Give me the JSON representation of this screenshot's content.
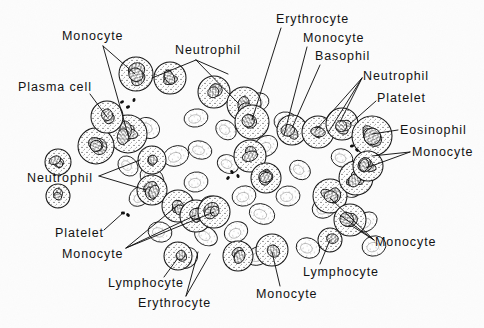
{
  "figure": {
    "background_color": "#fcfcfc",
    "ink_color": "#111111",
    "labels": [
      {
        "id": "monocyte-top-left",
        "text": "Monocyte",
        "x": 62,
        "y": 30
      },
      {
        "id": "neutrophil-top",
        "text": "Neutrophil",
        "x": 175,
        "y": 44
      },
      {
        "id": "erythrocyte-top-right",
        "text": "Erythrocyte",
        "x": 276,
        "y": 13
      },
      {
        "id": "monocyte-top-right",
        "text": "Monocyte",
        "x": 303,
        "y": 32
      },
      {
        "id": "basophil",
        "text": "Basophil",
        "x": 315,
        "y": 50
      },
      {
        "id": "plasma-cell",
        "text": "Plasma cell",
        "x": 18,
        "y": 81
      },
      {
        "id": "neutrophil-right",
        "text": "Neutrophil",
        "x": 363,
        "y": 70
      },
      {
        "id": "platelet-right",
        "text": "Platelet",
        "x": 377,
        "y": 92
      },
      {
        "id": "eosinophil",
        "text": "Eosinophil",
        "x": 400,
        "y": 124
      },
      {
        "id": "monocyte-right-upper",
        "text": "Monocyte",
        "x": 412,
        "y": 146
      },
      {
        "id": "neutrophil-left",
        "text": "Neutrophil",
        "x": 27,
        "y": 172
      },
      {
        "id": "platelet-left",
        "text": "Platelet",
        "x": 55,
        "y": 227
      },
      {
        "id": "monocyte-left-lower",
        "text": "Monocyte",
        "x": 62,
        "y": 248
      },
      {
        "id": "monocyte-right-lower",
        "text": "Monocyte",
        "x": 375,
        "y": 236
      },
      {
        "id": "lymphocyte-right",
        "text": "Lymphocyte",
        "x": 303,
        "y": 266
      },
      {
        "id": "lymphocyte-bottom-left",
        "text": "Lymphocyte",
        "x": 108,
        "y": 277
      },
      {
        "id": "monocyte-bottom",
        "text": "Monocyte",
        "x": 256,
        "y": 288
      },
      {
        "id": "erythrocyte-bottom",
        "text": "Erythrocyte",
        "x": 138,
        "y": 297
      }
    ],
    "leader_lines": [
      {
        "id": "lead-monocyte-top-left-a",
        "x1": 103,
        "y1": 46,
        "x2": 135,
        "y2": 74
      },
      {
        "id": "lead-monocyte-top-left-b",
        "x1": 103,
        "y1": 46,
        "x2": 128,
        "y2": 135
      },
      {
        "id": "lead-neutrophil-top-a",
        "x1": 196,
        "y1": 60,
        "x2": 152,
        "y2": 78
      },
      {
        "id": "lead-neutrophil-top-b",
        "x1": 196,
        "y1": 60,
        "x2": 228,
        "y2": 74
      },
      {
        "id": "lead-neutrophil-top-c",
        "x1": 196,
        "y1": 60,
        "x2": 238,
        "y2": 103
      },
      {
        "id": "lead-plasma-cell",
        "x1": 90,
        "y1": 94,
        "x2": 107,
        "y2": 117
      },
      {
        "id": "lead-erythrocyte-top-right",
        "x1": 281,
        "y1": 28,
        "x2": 252,
        "y2": 120
      },
      {
        "id": "lead-monocyte-top-right",
        "x1": 307,
        "y1": 47,
        "x2": 284,
        "y2": 135
      },
      {
        "id": "lead-basophil",
        "x1": 320,
        "y1": 65,
        "x2": 292,
        "y2": 128
      },
      {
        "id": "lead-neutrophil-right-a",
        "x1": 362,
        "y1": 78,
        "x2": 316,
        "y2": 130
      },
      {
        "id": "lead-neutrophil-right-b",
        "x1": 362,
        "y1": 78,
        "x2": 328,
        "y2": 133
      },
      {
        "id": "lead-neutrophil-right-c",
        "x1": 362,
        "y1": 78,
        "x2": 340,
        "y2": 122
      },
      {
        "id": "lead-platelet-right",
        "x1": 376,
        "y1": 101,
        "x2": 350,
        "y2": 124
      },
      {
        "id": "lead-eosinophil",
        "x1": 398,
        "y1": 130,
        "x2": 372,
        "y2": 134
      },
      {
        "id": "lead-monocyte-right-upper-a",
        "x1": 410,
        "y1": 152,
        "x2": 372,
        "y2": 156
      },
      {
        "id": "lead-monocyte-right-upper-b",
        "x1": 410,
        "y1": 152,
        "x2": 366,
        "y2": 168
      },
      {
        "id": "lead-neutrophil-left-a",
        "x1": 99,
        "y1": 176,
        "x2": 140,
        "y2": 160
      },
      {
        "id": "lead-neutrophil-left-b",
        "x1": 99,
        "y1": 176,
        "x2": 146,
        "y2": 190
      },
      {
        "id": "lead-platelet-left",
        "x1": 104,
        "y1": 230,
        "x2": 124,
        "y2": 212
      },
      {
        "id": "lead-monocyte-left-lower-a",
        "x1": 126,
        "y1": 248,
        "x2": 178,
        "y2": 205
      },
      {
        "id": "lead-monocyte-left-lower-b",
        "x1": 126,
        "y1": 248,
        "x2": 196,
        "y2": 215
      },
      {
        "id": "lead-monocyte-left-lower-c",
        "x1": 126,
        "y1": 248,
        "x2": 214,
        "y2": 212
      },
      {
        "id": "lead-lymphocyte-bottom-left",
        "x1": 164,
        "y1": 277,
        "x2": 178,
        "y2": 258
      },
      {
        "id": "lead-erythrocyte-bottom-a",
        "x1": 186,
        "y1": 296,
        "x2": 198,
        "y2": 252
      },
      {
        "id": "lead-erythrocyte-bottom-b",
        "x1": 186,
        "y1": 296,
        "x2": 210,
        "y2": 254
      },
      {
        "id": "lead-monocyte-bottom",
        "x1": 280,
        "y1": 286,
        "x2": 272,
        "y2": 252
      },
      {
        "id": "lead-lymphocyte-right",
        "x1": 320,
        "y1": 264,
        "x2": 330,
        "y2": 240
      },
      {
        "id": "lead-monocyte-right-lower-a",
        "x1": 374,
        "y1": 240,
        "x2": 330,
        "y2": 198
      },
      {
        "id": "lead-monocyte-right-lower-b",
        "x1": 374,
        "y1": 240,
        "x2": 340,
        "y2": 215
      },
      {
        "id": "lead-monocyte-right-lower-c",
        "x1": 374,
        "y1": 240,
        "x2": 352,
        "y2": 226
      }
    ],
    "cells": {
      "erythrocytes": [
        {
          "cx": 176,
          "cy": 156,
          "rx": 13,
          "ry": 10,
          "rot": -20
        },
        {
          "cx": 200,
          "cy": 150,
          "rx": 12,
          "ry": 9,
          "rot": 15
        },
        {
          "cx": 152,
          "cy": 178,
          "rx": 13,
          "ry": 10,
          "rot": 40
        },
        {
          "cx": 196,
          "cy": 182,
          "rx": 12,
          "ry": 10,
          "rot": -10
        },
        {
          "cx": 228,
          "cy": 164,
          "rx": 11,
          "ry": 9,
          "rot": 25
        },
        {
          "cx": 178,
          "cy": 204,
          "rx": 13,
          "ry": 9,
          "rot": -35
        },
        {
          "cx": 212,
          "cy": 206,
          "rx": 12,
          "ry": 10,
          "rot": 10
        },
        {
          "cx": 244,
          "cy": 196,
          "rx": 12,
          "ry": 10,
          "rot": -15
        },
        {
          "cx": 262,
          "cy": 214,
          "rx": 13,
          "ry": 10,
          "rot": 20
        },
        {
          "cx": 236,
          "cy": 232,
          "rx": 12,
          "ry": 10,
          "rot": -25
        },
        {
          "cx": 206,
          "cy": 236,
          "rx": 12,
          "ry": 9,
          "rot": 30
        },
        {
          "cx": 288,
          "cy": 196,
          "rx": 12,
          "ry": 10,
          "rot": -5
        },
        {
          "cx": 300,
          "cy": 170,
          "rx": 11,
          "ry": 9,
          "rot": 35
        },
        {
          "cx": 266,
          "cy": 146,
          "rx": 12,
          "ry": 10,
          "rot": -30
        },
        {
          "cx": 128,
          "cy": 166,
          "rx": 11,
          "ry": 9,
          "rot": 45
        },
        {
          "cx": 140,
          "cy": 196,
          "rx": 12,
          "ry": 9,
          "rot": -40
        },
        {
          "cx": 160,
          "cy": 232,
          "rx": 12,
          "ry": 10,
          "rot": 15
        },
        {
          "cx": 324,
          "cy": 208,
          "rx": 12,
          "ry": 10,
          "rot": -20
        },
        {
          "cx": 350,
          "cy": 188,
          "rx": 11,
          "ry": 9,
          "rot": 25
        },
        {
          "cx": 366,
          "cy": 222,
          "rx": 12,
          "ry": 9,
          "rot": -35
        },
        {
          "cx": 286,
          "cy": 122,
          "rx": 12,
          "ry": 10,
          "rot": 10
        },
        {
          "cx": 258,
          "cy": 102,
          "rx": 11,
          "ry": 9,
          "rot": -15
        },
        {
          "cx": 308,
          "cy": 248,
          "rx": 12,
          "ry": 10,
          "rot": 20
        },
        {
          "cx": 258,
          "cy": 256,
          "rx": 12,
          "ry": 9,
          "rot": -20
        },
        {
          "cx": 148,
          "cy": 128,
          "rx": 12,
          "ry": 10,
          "rot": 30
        },
        {
          "cx": 196,
          "cy": 118,
          "rx": 12,
          "ry": 9,
          "rot": -10
        },
        {
          "cx": 226,
          "cy": 130,
          "rx": 11,
          "ry": 9,
          "rot": 40
        },
        {
          "cx": 374,
          "cy": 246,
          "rx": 12,
          "ry": 10,
          "rot": -15
        },
        {
          "cx": 342,
          "cy": 158,
          "rx": 11,
          "ry": 9,
          "rot": 20
        },
        {
          "cx": 186,
          "cy": 258,
          "rx": 12,
          "ry": 10,
          "rot": -30
        }
      ],
      "leukocytes": [
        {
          "cx": 136,
          "cy": 74,
          "r": 17
        },
        {
          "cx": 170,
          "cy": 78,
          "r": 16
        },
        {
          "cx": 128,
          "cy": 134,
          "r": 19
        },
        {
          "cx": 96,
          "cy": 146,
          "r": 18
        },
        {
          "cx": 152,
          "cy": 160,
          "r": 14
        },
        {
          "cx": 214,
          "cy": 92,
          "r": 16
        },
        {
          "cx": 244,
          "cy": 104,
          "r": 17
        },
        {
          "cx": 152,
          "cy": 190,
          "r": 15
        },
        {
          "cx": 178,
          "cy": 206,
          "r": 16
        },
        {
          "cx": 196,
          "cy": 216,
          "r": 16
        },
        {
          "cx": 214,
          "cy": 212,
          "r": 16
        },
        {
          "cx": 252,
          "cy": 122,
          "r": 17
        },
        {
          "cx": 250,
          "cy": 156,
          "r": 16
        },
        {
          "cx": 266,
          "cy": 178,
          "r": 15
        },
        {
          "cx": 292,
          "cy": 130,
          "r": 15
        },
        {
          "cx": 318,
          "cy": 132,
          "r": 16
        },
        {
          "cx": 342,
          "cy": 124,
          "r": 16
        },
        {
          "cx": 372,
          "cy": 136,
          "r": 20
        },
        {
          "cx": 330,
          "cy": 196,
          "r": 17
        },
        {
          "cx": 356,
          "cy": 178,
          "r": 17
        },
        {
          "cx": 350,
          "cy": 220,
          "r": 16
        },
        {
          "cx": 368,
          "cy": 166,
          "r": 15
        },
        {
          "cx": 330,
          "cy": 240,
          "r": 12
        },
        {
          "cx": 272,
          "cy": 250,
          "r": 16
        },
        {
          "cx": 238,
          "cy": 256,
          "r": 15
        },
        {
          "cx": 178,
          "cy": 256,
          "r": 14
        },
        {
          "cx": 58,
          "cy": 162,
          "r": 13
        },
        {
          "cx": 107,
          "cy": 117,
          "r": 16
        },
        {
          "cx": 58,
          "cy": 196,
          "r": 12
        }
      ],
      "platelets": [
        {
          "cx": 122,
          "cy": 102
        },
        {
          "cx": 128,
          "cy": 107
        },
        {
          "cx": 134,
          "cy": 100
        },
        {
          "cx": 232,
          "cy": 172
        },
        {
          "cx": 238,
          "cy": 176
        },
        {
          "cx": 228,
          "cy": 178
        },
        {
          "cx": 352,
          "cy": 146
        },
        {
          "cx": 357,
          "cy": 150
        },
        {
          "cx": 123,
          "cy": 213
        },
        {
          "cx": 128,
          "cy": 215
        }
      ]
    }
  }
}
